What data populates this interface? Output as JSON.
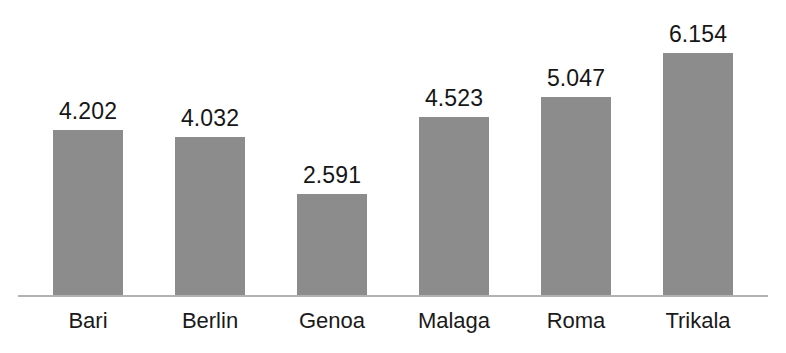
{
  "chart_data": {
    "type": "bar",
    "title": "",
    "subtitle": "",
    "xlabel": "",
    "ylabel": "",
    "categories": [
      "Bari",
      "Berlin",
      "Genoa",
      "Malaga",
      "Roma",
      "Trikala"
    ],
    "values": [
      4.202,
      4.032,
      2.591,
      4.523,
      5.047,
      6.154
    ],
    "value_labels": [
      "4.202",
      "4.032",
      "2.591",
      "4.523",
      "5.047",
      "6.154"
    ],
    "series": [
      {
        "name": "",
        "values": [
          4.202,
          4.032,
          2.591,
          4.523,
          5.047,
          6.154
        ]
      }
    ],
    "ylim": [
      0,
      6.6
    ],
    "grid": false,
    "legend": false,
    "legend_position": "none",
    "data_labels_shown": true,
    "y_axis_visible": false,
    "x_axis_visible": true,
    "colors": {
      "bar": "#8c8c8c",
      "axis_line": "#b2b2b2",
      "value_label_text": "#161616",
      "category_label_text": "#1a1a1a",
      "background": "#ffffff"
    }
  }
}
